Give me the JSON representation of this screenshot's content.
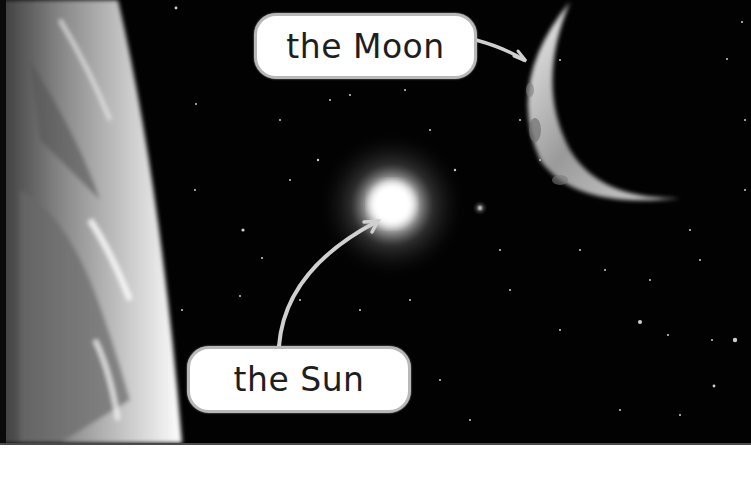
{
  "scene": {
    "description": "Space illustration showing Earth's limb, the Sun, and a crescent Moon with labeled callouts",
    "style": "grayscale"
  },
  "labels": {
    "moon": {
      "text": "the Moon",
      "points_to": "moon"
    },
    "sun": {
      "text": "the Sun",
      "points_to": "sun"
    }
  },
  "objects": [
    {
      "name": "earth",
      "position": "left edge, curved limb"
    },
    {
      "name": "sun",
      "position": "center",
      "appearance": "bright glowing star"
    },
    {
      "name": "moon",
      "position": "upper right",
      "appearance": "crescent"
    }
  ],
  "colors": {
    "space": "#020202",
    "label_bg": "#ffffff",
    "label_border": "#b8b8b8",
    "label_text": "#1e1e1e",
    "arrow": "#d0d0d0"
  }
}
